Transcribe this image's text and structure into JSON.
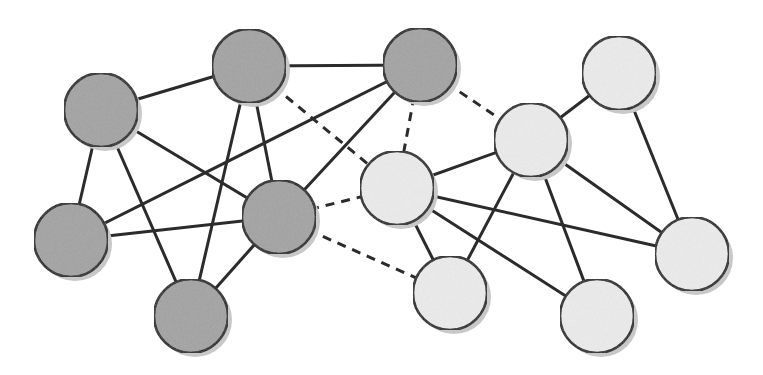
{
  "diagram": {
    "type": "network-graph",
    "colors": {
      "group_dark": "#a3a3a3",
      "group_light": "#ececec",
      "edge": "#2b2b2b",
      "outline": "#1e1e1e",
      "shadow": "#c8c8c8"
    },
    "node_radius": 37,
    "nodes": [
      {
        "id": "A",
        "x": 101,
        "y": 110,
        "group": "dark"
      },
      {
        "id": "B",
        "x": 249,
        "y": 66,
        "group": "dark"
      },
      {
        "id": "C",
        "x": 420,
        "y": 65,
        "group": "dark"
      },
      {
        "id": "D",
        "x": 71,
        "y": 240,
        "group": "dark"
      },
      {
        "id": "E",
        "x": 279,
        "y": 217,
        "group": "dark"
      },
      {
        "id": "F",
        "x": 191,
        "y": 316,
        "group": "dark"
      },
      {
        "id": "G",
        "x": 397,
        "y": 188,
        "group": "light"
      },
      {
        "id": "H",
        "x": 531,
        "y": 140,
        "group": "light"
      },
      {
        "id": "I",
        "x": 619,
        "y": 73,
        "group": "light"
      },
      {
        "id": "J",
        "x": 450,
        "y": 293,
        "group": "light"
      },
      {
        "id": "K",
        "x": 597,
        "y": 316,
        "group": "light"
      },
      {
        "id": "L",
        "x": 692,
        "y": 254,
        "group": "light"
      }
    ],
    "edges": [
      {
        "from": "A",
        "to": "B",
        "style": "solid"
      },
      {
        "from": "A",
        "to": "D",
        "style": "solid"
      },
      {
        "from": "A",
        "to": "F",
        "style": "solid"
      },
      {
        "from": "A",
        "to": "E",
        "style": "solid"
      },
      {
        "from": "B",
        "to": "C",
        "style": "solid"
      },
      {
        "from": "B",
        "to": "F",
        "style": "solid"
      },
      {
        "from": "B",
        "to": "E",
        "style": "solid"
      },
      {
        "from": "C",
        "to": "D",
        "style": "solid"
      },
      {
        "from": "C",
        "to": "E",
        "style": "solid"
      },
      {
        "from": "D",
        "to": "E",
        "style": "solid"
      },
      {
        "from": "E",
        "to": "F",
        "style": "solid"
      },
      {
        "from": "B",
        "to": "G",
        "style": "dashed"
      },
      {
        "from": "C",
        "to": "G",
        "style": "dashed"
      },
      {
        "from": "C",
        "to": "H",
        "style": "dashed"
      },
      {
        "from": "E",
        "to": "G",
        "style": "dashed"
      },
      {
        "from": "E",
        "to": "J",
        "style": "dashed"
      },
      {
        "from": "G",
        "to": "H",
        "style": "solid"
      },
      {
        "from": "H",
        "to": "I",
        "style": "solid"
      },
      {
        "from": "I",
        "to": "L",
        "style": "solid"
      },
      {
        "from": "G",
        "to": "J",
        "style": "solid"
      },
      {
        "from": "G",
        "to": "K",
        "style": "solid"
      },
      {
        "from": "G",
        "to": "L",
        "style": "solid"
      },
      {
        "from": "H",
        "to": "J",
        "style": "solid"
      },
      {
        "from": "H",
        "to": "K",
        "style": "solid"
      },
      {
        "from": "H",
        "to": "L",
        "style": "solid"
      }
    ]
  }
}
